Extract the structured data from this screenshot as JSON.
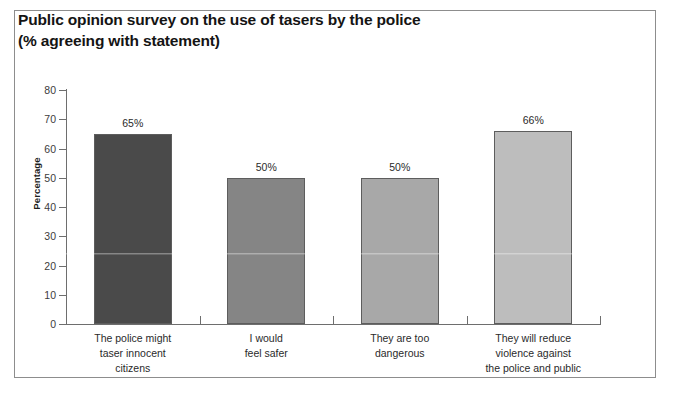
{
  "chart_data": {
    "type": "bar",
    "title": "Public opinion survey on the use of tasers by the police\n(% agreeing with statement)",
    "title_line1": "Public opinion survey on the use of tasers by the police",
    "title_line2": "(% agreeing with statement)",
    "xlabel": "",
    "ylabel": "Percentage",
    "ylim": [
      0,
      80
    ],
    "ytick_labels": [
      "80",
      "70",
      "60",
      "50",
      "40",
      "30",
      "20",
      "10",
      "0"
    ],
    "ytick_values": [
      80,
      70,
      60,
      50,
      40,
      30,
      20,
      10,
      0
    ],
    "grid": false,
    "legend": "none",
    "categories": [
      "The police might\ntaser innocent\ncitizens",
      "I would\nfeel safer",
      "They are too\ndangerous",
      "They will reduce\nviolence against\nthe police and public"
    ],
    "values": [
      65,
      50,
      50,
      66
    ],
    "value_labels": [
      "65%",
      "50%",
      "50%",
      "66%"
    ],
    "bar_colors": [
      "#4a4a4a",
      "#858585",
      "#a8a8a8",
      "#bdbdbd"
    ]
  }
}
